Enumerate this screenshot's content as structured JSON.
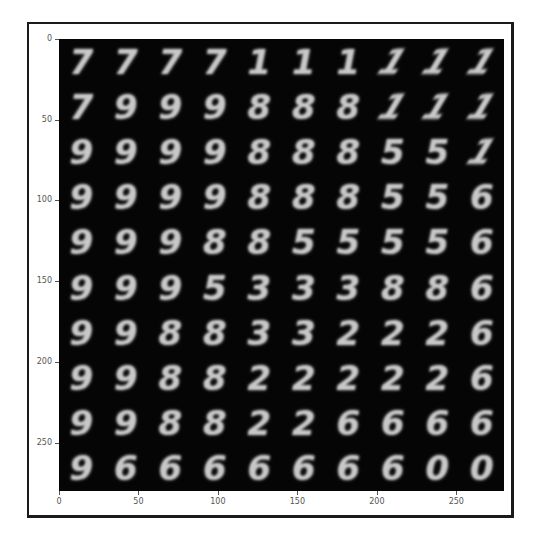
{
  "chart_data": {
    "type": "heatmap",
    "subtype": "image-grid (imshow)",
    "title": "",
    "xlabel": "",
    "ylabel": "",
    "xlim": [
      0,
      280
    ],
    "ylim": [
      280,
      0
    ],
    "x_ticks": [
      0,
      50,
      100,
      150,
      200,
      250
    ],
    "y_ticks": [
      0,
      50,
      100,
      150,
      200,
      250
    ],
    "grid": false,
    "colormap": "gray",
    "image_size": [
      280,
      280
    ],
    "cell_size": 28,
    "rows": 10,
    "cols": 10,
    "digits": [
      [
        "7",
        "7",
        "7",
        "7",
        "1",
        "1",
        "1",
        "1",
        "1",
        "1"
      ],
      [
        "7",
        "9",
        "9",
        "9",
        "8",
        "8",
        "8",
        "1",
        "1",
        "1"
      ],
      [
        "9",
        "9",
        "9",
        "9",
        "8",
        "8",
        "8",
        "5",
        "5",
        "1"
      ],
      [
        "9",
        "9",
        "9",
        "9",
        "8",
        "8",
        "8",
        "5",
        "5",
        "6"
      ],
      [
        "9",
        "9",
        "9",
        "8",
        "8",
        "5",
        "5",
        "5",
        "5",
        "6"
      ],
      [
        "9",
        "9",
        "9",
        "5",
        "3",
        "3",
        "3",
        "8",
        "8",
        "6"
      ],
      [
        "9",
        "9",
        "8",
        "8",
        "3",
        "3",
        "2",
        "2",
        "2",
        "6"
      ],
      [
        "9",
        "9",
        "8",
        "8",
        "2",
        "2",
        "2",
        "2",
        "2",
        "6"
      ],
      [
        "9",
        "9",
        "8",
        "8",
        "2",
        "2",
        "6",
        "6",
        "6",
        "6"
      ],
      [
        "9",
        "6",
        "6",
        "6",
        "6",
        "6",
        "6",
        "6",
        "0",
        "0"
      ]
    ]
  },
  "axes": {
    "x_tick_labels": [
      "0",
      "50",
      "100",
      "150",
      "200",
      "250"
    ],
    "y_tick_labels": [
      "0",
      "50",
      "100",
      "150",
      "200",
      "250"
    ]
  }
}
